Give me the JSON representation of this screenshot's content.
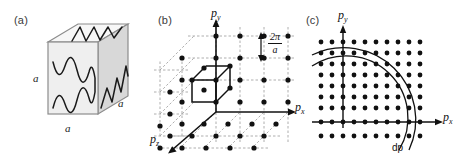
{
  "figure": {
    "background": "#ffffff",
    "width": 460,
    "height": 160
  },
  "panels": [
    {
      "id": "a",
      "label": "(a)",
      "caption_concept": "cubic box of side a with standing wave modes on faces",
      "dimension_labels": [
        "a",
        "a",
        "a"
      ],
      "cube": {
        "front_face_color": "#efefef",
        "top_face_color": "#f7f7f7",
        "right_face_color": "#d8d8d8",
        "edge_color": "#8c8c8c",
        "wave_color": "#1a1a1a",
        "front_wave_cycles": 4,
        "top_wave_cycles": 2,
        "right_wave_cycles": 2
      }
    },
    {
      "id": "b",
      "label": "(b)",
      "caption_concept": "momentum-space cubic lattice of allowed states with spacing 2 pi over a",
      "axes": [
        {
          "name": "px",
          "label_text": "p",
          "label_sub": "x"
        },
        {
          "name": "py",
          "label_text": "p",
          "label_sub": "y"
        },
        {
          "name": "pz",
          "label_text": "p",
          "label_sub": "z"
        }
      ],
      "spacing_annotation": {
        "numerator": "2π",
        "denominator": "a",
        "arrow": "double-headed-vertical"
      },
      "lattice": {
        "dot_color": "#111111",
        "grid_line_color": "#9a9a9a",
        "unit_cell_color": "#111111",
        "columns": 4,
        "rows": 4,
        "depth_layers": 4,
        "dot_radius": 2.6
      }
    },
    {
      "id": "c",
      "label": "(c)",
      "caption_concept": "two-dimensional slice of the momentum lattice with a thin spherical shell of thickness dp",
      "axes": [
        {
          "name": "px",
          "label_text": "p",
          "label_sub": "x"
        },
        {
          "name": "py",
          "label_text": "p",
          "label_sub": "y"
        }
      ],
      "shell_label": "dp",
      "lattice": {
        "dot_color": "#111111",
        "columns": 9,
        "rows": 9,
        "dot_radius": 2.4,
        "spacing": 11
      },
      "arcs": {
        "color": "#111111",
        "inner_radius": 62,
        "outer_radius": 72
      }
    }
  ],
  "colors": {
    "ink": "#111111",
    "muted_ink": "#3a3a3a",
    "grid": "#9a9a9a",
    "cube_front": "#efefef",
    "cube_top": "#f7f7f7",
    "cube_right": "#d8d8d8",
    "cube_edge": "#8c8c8c"
  }
}
